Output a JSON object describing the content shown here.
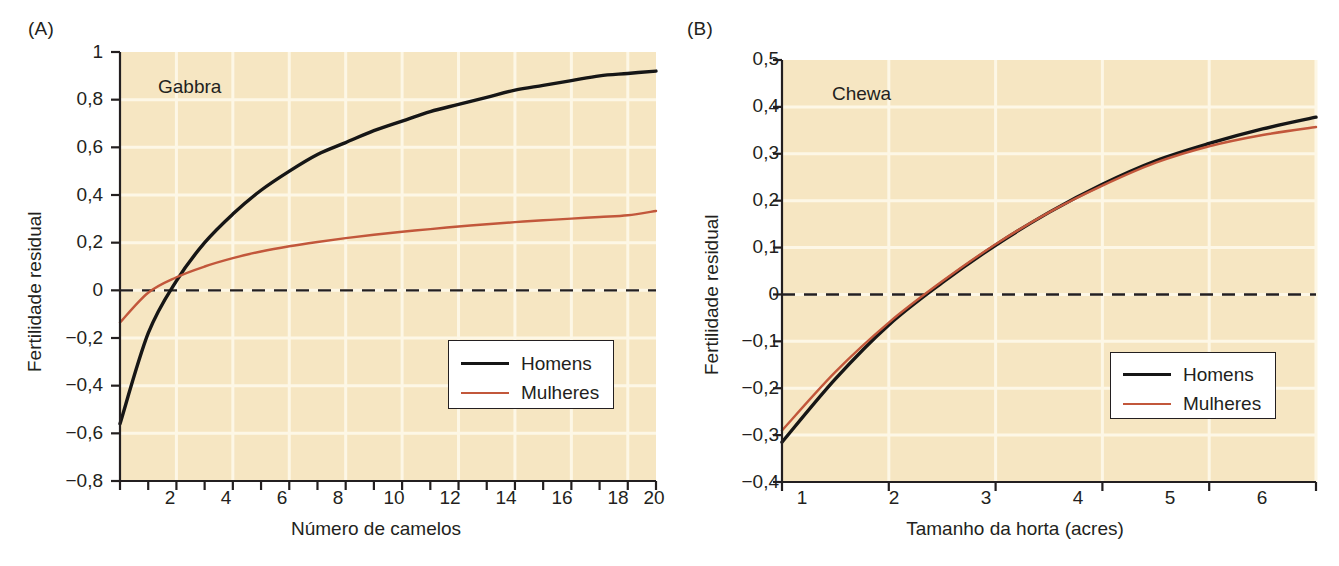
{
  "figure": {
    "background_color": "#ffffff",
    "plot_background_color": "#f6e6c2",
    "gridline_color": "#fdf7e6",
    "axis_color": "#231f20",
    "series_colors": {
      "homens": "#161616",
      "mulheres": "#c2573b"
    }
  },
  "chart_data": [
    {
      "type": "line",
      "panel_letter": "(A)",
      "title": "Gabbra",
      "xlabel": "Número de camelos",
      "ylabel": "Fertilidade residual",
      "xlim": [
        1,
        20
      ],
      "ylim": [
        -0.8,
        1.0
      ],
      "xticks": [
        2,
        4,
        6,
        8,
        10,
        12,
        14,
        16,
        18,
        20
      ],
      "xtick_labels": [
        "2",
        "4",
        "6",
        "8",
        "10",
        "12",
        "14",
        "16",
        "18",
        "20"
      ],
      "yticks": [
        -0.8,
        -0.6,
        -0.4,
        -0.2,
        0,
        0.2,
        0.4,
        0.6,
        0.8,
        1
      ],
      "ytick_labels": [
        "−0,8",
        "−0,6",
        "−0,4",
        "−0,2",
        "0",
        "0,2",
        "0,4",
        "0,6",
        "0,8",
        "1"
      ],
      "grid": true,
      "zero_reference_line": 0,
      "legend_position": "lower right",
      "x": [
        1,
        2,
        3,
        4,
        5,
        6,
        7,
        8,
        9,
        10,
        11,
        12,
        13,
        14,
        15,
        16,
        17,
        18,
        19,
        20
      ],
      "series": [
        {
          "name": "Homens",
          "color": "#161616",
          "values": [
            -0.56,
            -0.18,
            0.04,
            0.2,
            0.32,
            0.42,
            0.5,
            0.57,
            0.62,
            0.67,
            0.71,
            0.75,
            0.78,
            0.81,
            0.84,
            0.86,
            0.88,
            0.9,
            0.91,
            0.92
          ]
        },
        {
          "name": "Mulheres",
          "color": "#c2573b",
          "values": [
            -0.135,
            -0.01,
            0.055,
            0.1,
            0.135,
            0.163,
            0.185,
            0.203,
            0.219,
            0.233,
            0.246,
            0.257,
            0.268,
            0.277,
            0.286,
            0.294,
            0.301,
            0.308,
            0.315,
            0.333
          ]
        }
      ],
      "legend": [
        {
          "label": "Homens",
          "color": "#161616"
        },
        {
          "label": "Mulheres",
          "color": "#c2573b"
        }
      ]
    },
    {
      "type": "line",
      "panel_letter": "(B)",
      "title": "Chewa",
      "xlabel": "Tamanho da horta (acres)",
      "ylabel": "Fertilidade residual",
      "xlim": [
        1,
        6
      ],
      "ylim": [
        -0.4,
        0.5
      ],
      "xticks": [
        1,
        2,
        3,
        4,
        5,
        6
      ],
      "xtick_labels": [
        "1",
        "2",
        "3",
        "4",
        "5",
        "6"
      ],
      "yticks": [
        -0.4,
        -0.3,
        -0.2,
        -0.1,
        0,
        0.1,
        0.2,
        0.3,
        0.4,
        0.5
      ],
      "ytick_labels": [
        "−0,4",
        "−0,3",
        "−0,2",
        "−0,1",
        "0",
        "0,1",
        "0,2",
        "0,3",
        "0,4",
        "0,5"
      ],
      "grid": true,
      "zero_reference_line": 0,
      "legend_position": "lower right",
      "x": [
        1,
        1.5,
        2,
        2.5,
        3,
        3.5,
        4,
        4.5,
        5,
        5.5,
        6
      ],
      "series": [
        {
          "name": "Homens",
          "color": "#161616",
          "values": [
            -0.315,
            -0.18,
            -0.065,
            0.025,
            0.105,
            0.175,
            0.235,
            0.285,
            0.322,
            0.353,
            0.378
          ]
        },
        {
          "name": "Mulheres",
          "color": "#c2573b",
          "values": [
            -0.29,
            -0.165,
            -0.06,
            0.028,
            0.107,
            0.175,
            0.232,
            0.281,
            0.316,
            0.34,
            0.357
          ]
        }
      ],
      "legend": [
        {
          "label": "Homens",
          "color": "#c2573b"
        },
        {
          "label": "Mulheres",
          "color": "#c2573b"
        }
      ]
    }
  ],
  "panel_a": {
    "letter": "(A)",
    "group_label": "Gabbra",
    "axis_title_x": "Número de camelos",
    "axis_title_y": "Fertilidade residual",
    "ytick_labels": [
      "1",
      "0,8",
      "0,6",
      "0,4",
      "0,2",
      "0",
      "−0,2",
      "−0,4",
      "−0,6",
      "−0,8"
    ],
    "xtick_labels": [
      "2",
      "4",
      "6",
      "8",
      "10",
      "12",
      "14",
      "16",
      "18",
      "20"
    ],
    "legend": {
      "men": "Homens",
      "women": "Mulheres"
    }
  },
  "panel_b": {
    "letter": "(B)",
    "group_label": "Chewa",
    "axis_title_x": "Tamanho da horta (acres)",
    "axis_title_y": "Fertilidade residual",
    "ytick_labels": [
      "0,5",
      "0,4",
      "0,3",
      "0,2",
      "0,1",
      "0",
      "−0,1",
      "−0,2",
      "−0,3",
      "−0,4"
    ],
    "xtick_labels": [
      "1",
      "2",
      "3",
      "4",
      "5",
      "6"
    ],
    "legend": {
      "men": "Homens",
      "women": "Mulheres"
    }
  }
}
